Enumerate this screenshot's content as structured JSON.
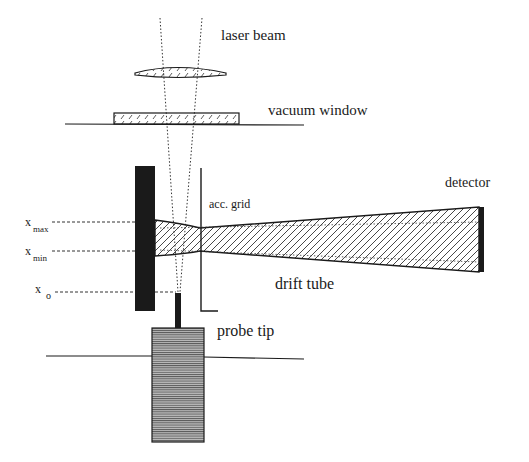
{
  "diagram": {
    "type": "schematic",
    "labels": {
      "laser_beam": "laser beam",
      "vacuum_window": "vacuum window",
      "acc_grid": "acc. grid",
      "detector": "detector",
      "drift_tube": "drift tube",
      "probe_tip": "probe tip",
      "x_max_base": "x",
      "x_max_sub": "max",
      "x_min_base": "x",
      "x_min_sub": "min",
      "x_0_base": "x",
      "x_0_sub": "o"
    },
    "colors": {
      "ink": "#1a1a1a",
      "hatch": "#333333",
      "background": "#ffffff"
    }
  }
}
